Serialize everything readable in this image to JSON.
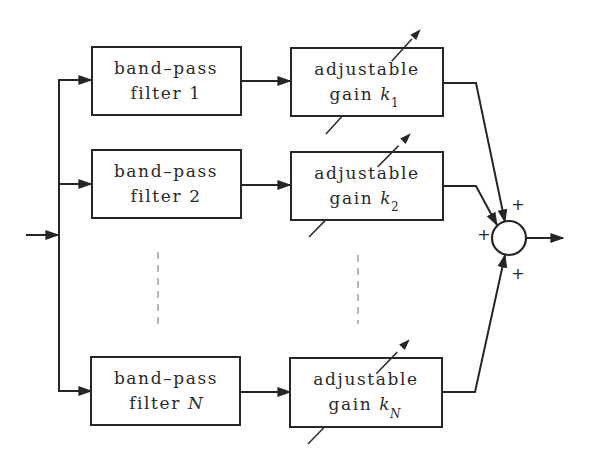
{
  "diagram": {
    "type": "block-diagram",
    "input": {
      "label": ""
    },
    "output": {
      "label": ""
    },
    "branches": [
      {
        "filter": {
          "line1": "band–pass",
          "line2_text": "filter",
          "line2_index": "1",
          "index_italic": false
        },
        "gain": {
          "line1": "adjustable",
          "line2_text": "gain",
          "symbol": "k",
          "subscript": "1"
        }
      },
      {
        "filter": {
          "line1": "band–pass",
          "line2_text": "filter",
          "line2_index": "2",
          "index_italic": false
        },
        "gain": {
          "line1": "adjustable",
          "line2_text": "gain",
          "symbol": "k",
          "subscript": "2"
        }
      },
      {
        "filter": {
          "line1": "band–pass",
          "line2_text": "filter",
          "line2_index": "N",
          "index_italic": true
        },
        "gain": {
          "line1": "adjustable",
          "line2_text": "gain",
          "symbol": "k",
          "subscript": "N"
        }
      }
    ],
    "ellipsis": "vertical dashed lines indicating branches 3 … N-1",
    "summing_junction": {
      "signs": [
        "+",
        "+",
        "+"
      ],
      "inputs": [
        "branch 1 (top)",
        "branch 2 (left)",
        "branch N (bottom)"
      ]
    }
  }
}
